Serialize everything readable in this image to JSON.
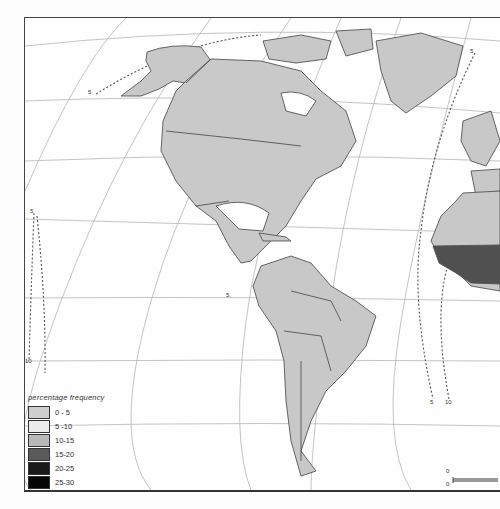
{
  "legend": {
    "title": "percentage frequency",
    "items": [
      {
        "label": "0 - 5",
        "color": "#cfcfcf"
      },
      {
        "label": "5 -10",
        "color": "#ececec"
      },
      {
        "label": "10-15",
        "color": "#b8b8b8"
      },
      {
        "label": "15-20",
        "color": "#5a5a5a"
      },
      {
        "label": "20-25",
        "color": "#1a1a1a"
      },
      {
        "label": "25-30",
        "color": "#050505"
      }
    ]
  },
  "isoline_labels": [
    {
      "text": "5",
      "x": 90,
      "y": 92
    },
    {
      "text": "5",
      "x": 31,
      "y": 210
    },
    {
      "text": "10",
      "x": 27,
      "y": 360
    },
    {
      "text": "5.",
      "x": 227,
      "y": 294
    },
    {
      "text": "5",
      "x": 471,
      "y": 50
    },
    {
      "text": "5",
      "x": 431,
      "y": 400
    },
    {
      "text": "10",
      "x": 446,
      "y": 400
    }
  ],
  "scale_bar": {
    "top_label": "0",
    "bottom_label": "0"
  },
  "colors": {
    "land": "#c8c8c8",
    "high": "#505050",
    "lines": "#9a9a9a"
  }
}
